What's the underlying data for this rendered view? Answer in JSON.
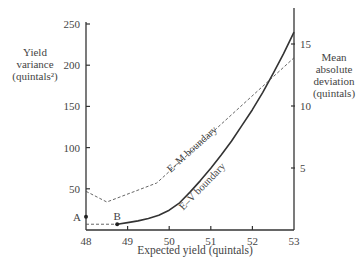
{
  "chart_data": {
    "type": "line",
    "title": "",
    "xlabel": "Expected yield (quintals)",
    "ylabel": "Yield variance (quintals²)",
    "ylabel_lines": [
      "Yield",
      "variance",
      "(quintals²)"
    ],
    "y2label": "Mean absolute deviation (quintals)",
    "y2label_lines": [
      "Mean",
      "absolute",
      "deviation",
      "(quintals)"
    ],
    "xlim": [
      48,
      53
    ],
    "ylim": [
      0,
      250
    ],
    "y2lim": [
      0,
      17.9
    ],
    "xticks": [
      48,
      49,
      50,
      51,
      52,
      53
    ],
    "yticks": [
      50,
      100,
      150,
      200,
      250
    ],
    "y2ticks": [
      5,
      10,
      15
    ],
    "grid": false,
    "legend": "none (inline curve labels)",
    "series": [
      {
        "name": "E-V boundary",
        "label": "E–V boundary",
        "style": "solid",
        "color": "#333333",
        "x": [
          48.75,
          49,
          49.25,
          49.5,
          49.75,
          50,
          50.25,
          50.5,
          50.75,
          51,
          51.25,
          51.5,
          51.75,
          52,
          52.25,
          52.5,
          52.75,
          53
        ],
        "y": [
          7,
          9,
          11,
          14,
          18,
          24,
          33,
          46,
          60,
          75,
          91,
          108,
          127,
          146,
          167,
          190,
          214,
          240
        ]
      },
      {
        "name": "E-M boundary",
        "label": "E–M boundary",
        "style": "dashed",
        "color": "#555555",
        "x": [
          48,
          48.5,
          49.7,
          53
        ],
        "y": [
          47,
          34,
          57,
          209
        ]
      }
    ],
    "points": [
      {
        "label": "A",
        "x": 48,
        "y": 16
      },
      {
        "label": "B",
        "x": 48.75,
        "y": 7
      }
    ],
    "guides": [
      {
        "style": "dashed",
        "x": [
          48,
          48.75
        ],
        "y": [
          7,
          7
        ]
      }
    ],
    "annotations": [
      {
        "text": "E–M boundary",
        "x": 50.6,
        "y": 95,
        "angle": -42
      },
      {
        "text": "E–V boundary",
        "x": 50.85,
        "y": 50,
        "angle": -46
      }
    ]
  }
}
